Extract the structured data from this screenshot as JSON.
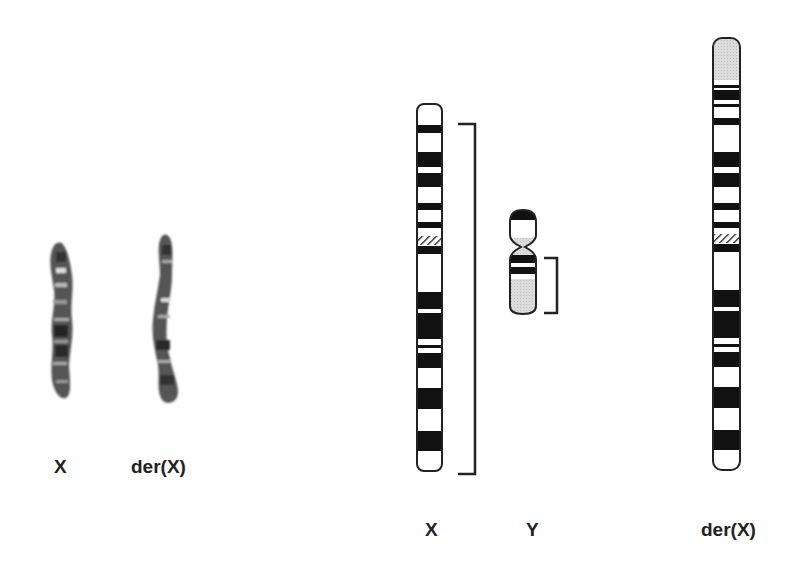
{
  "figure": {
    "left_panel": {
      "description": "G-banded photographs of chromosomes",
      "labels": [
        "X",
        "der(X)"
      ]
    },
    "right_panel": {
      "description": "Ideograms of chromosomes",
      "labels": [
        "X",
        "Y",
        "der(X)"
      ],
      "brackets": [
        {
          "target": "X",
          "meaning": "translocated segment region"
        },
        {
          "target": "Y",
          "meaning": "translocated segment region"
        }
      ]
    },
    "colors": {
      "band_dark": "#111111",
      "band_light": "#ffffff",
      "heterochromatin_gray": "#d8d8d8",
      "outline": "#222222"
    }
  }
}
